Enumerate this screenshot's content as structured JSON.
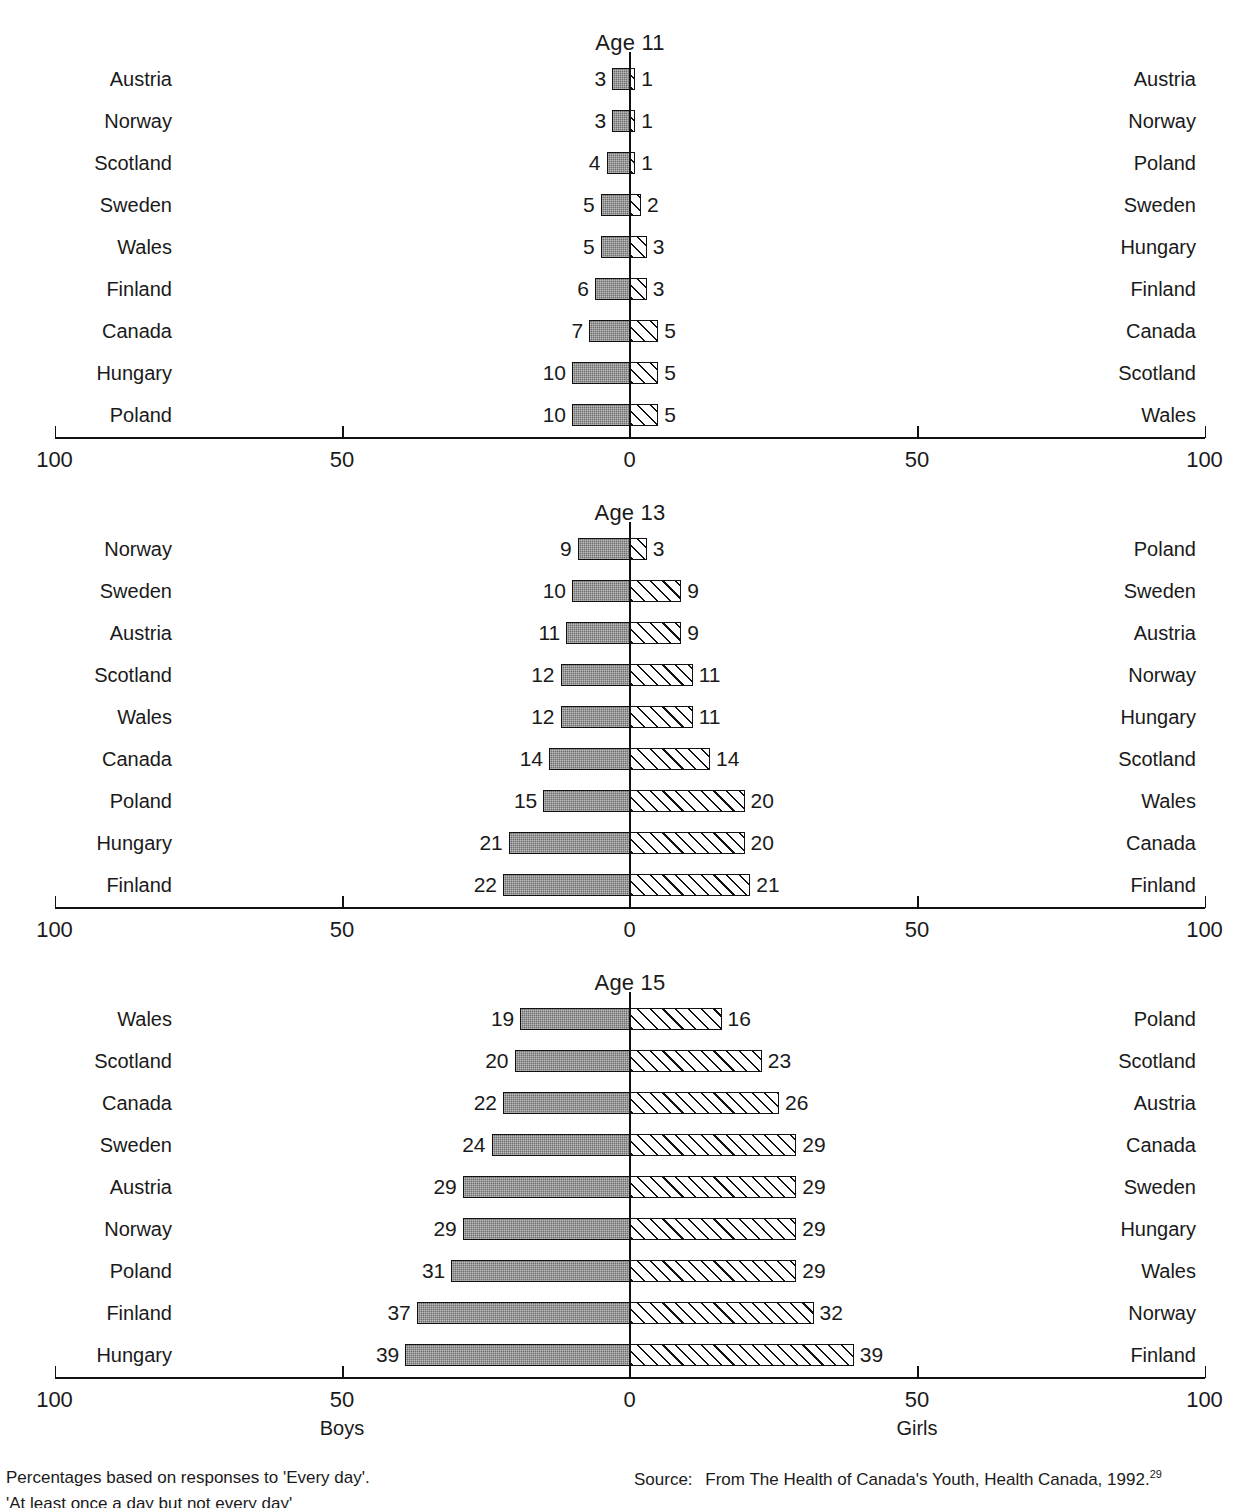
{
  "figure": {
    "title_cropped": "",
    "boys_caption": "Boys",
    "girls_caption": "Girls"
  },
  "axis": {
    "ticks": [
      "100",
      "50",
      "0",
      "50",
      "100"
    ],
    "min": 0,
    "max": 100
  },
  "footnotes": {
    "left_line1": "Percentages based on responses to 'Every day'.",
    "left_line2_cropped": "'At least once a day but not every day'",
    "source_label": "Source:",
    "source_text": "From The Health of Canada's Youth, Health Canada, 1992.",
    "source_superscript": "29"
  },
  "panels": [
    {
      "title": "Age 11",
      "rows": [
        {
          "left_label": "Austria",
          "boys": 3,
          "girls": 1,
          "right_label": "Austria"
        },
        {
          "left_label": "Norway",
          "boys": 3,
          "girls": 1,
          "right_label": "Norway"
        },
        {
          "left_label": "Scotland",
          "boys": 4,
          "girls": 1,
          "right_label": "Poland"
        },
        {
          "left_label": "Sweden",
          "boys": 5,
          "girls": 2,
          "right_label": "Sweden"
        },
        {
          "left_label": "Wales",
          "boys": 5,
          "girls": 3,
          "right_label": "Hungary"
        },
        {
          "left_label": "Finland",
          "boys": 6,
          "girls": 3,
          "right_label": "Finland"
        },
        {
          "left_label": "Canada",
          "boys": 7,
          "girls": 5,
          "right_label": "Canada"
        },
        {
          "left_label": "Hungary",
          "boys": 10,
          "girls": 5,
          "right_label": "Scotland"
        },
        {
          "left_label": "Poland",
          "boys": 10,
          "girls": 5,
          "right_label": "Wales"
        }
      ]
    },
    {
      "title": "Age 13",
      "rows": [
        {
          "left_label": "Norway",
          "boys": 9,
          "girls": 3,
          "right_label": "Poland"
        },
        {
          "left_label": "Sweden",
          "boys": 10,
          "girls": 9,
          "right_label": "Sweden"
        },
        {
          "left_label": "Austria",
          "boys": 11,
          "girls": 9,
          "right_label": "Austria"
        },
        {
          "left_label": "Scotland",
          "boys": 12,
          "girls": 11,
          "right_label": "Norway"
        },
        {
          "left_label": "Wales",
          "boys": 12,
          "girls": 11,
          "right_label": "Hungary"
        },
        {
          "left_label": "Canada",
          "boys": 14,
          "girls": 14,
          "right_label": "Scotland"
        },
        {
          "left_label": "Poland",
          "boys": 15,
          "girls": 20,
          "right_label": "Wales"
        },
        {
          "left_label": "Hungary",
          "boys": 21,
          "girls": 20,
          "right_label": "Canada"
        },
        {
          "left_label": "Finland",
          "boys": 22,
          "girls": 21,
          "right_label": "Finland"
        }
      ]
    },
    {
      "title": "Age 15",
      "rows": [
        {
          "left_label": "Wales",
          "boys": 19,
          "girls": 16,
          "right_label": "Poland"
        },
        {
          "left_label": "Scotland",
          "boys": 20,
          "girls": 23,
          "right_label": "Scotland"
        },
        {
          "left_label": "Canada",
          "boys": 22,
          "girls": 26,
          "right_label": "Austria"
        },
        {
          "left_label": "Sweden",
          "boys": 24,
          "girls": 29,
          "right_label": "Canada"
        },
        {
          "left_label": "Austria",
          "boys": 29,
          "girls": 29,
          "right_label": "Sweden"
        },
        {
          "left_label": "Norway",
          "boys": 29,
          "girls": 29,
          "right_label": "Hungary"
        },
        {
          "left_label": "Poland",
          "boys": 31,
          "girls": 29,
          "right_label": "Wales"
        },
        {
          "left_label": "Finland",
          "boys": 37,
          "girls": 32,
          "right_label": "Norway"
        },
        {
          "left_label": "Hungary",
          "boys": 39,
          "girls": 39,
          "right_label": "Finland"
        }
      ]
    }
  ],
  "chart_data": {
    "type": "bar",
    "subtype": "population-pyramid / back-to-back horizontal bar",
    "xlabel": "Percent",
    "ylabel": "",
    "xlim": [
      0,
      100
    ],
    "grid": false,
    "left_side": "Boys",
    "right_side": "Girls",
    "axis_ticks": [
      100,
      50,
      0,
      50,
      100
    ],
    "panels": [
      {
        "title": "Age 11",
        "categories_left": [
          "Austria",
          "Norway",
          "Scotland",
          "Sweden",
          "Wales",
          "Finland",
          "Canada",
          "Hungary",
          "Poland"
        ],
        "categories_right": [
          "Austria",
          "Norway",
          "Poland",
          "Sweden",
          "Hungary",
          "Finland",
          "Canada",
          "Scotland",
          "Wales"
        ],
        "series": [
          {
            "name": "Boys",
            "values": [
              3,
              3,
              4,
              5,
              5,
              6,
              7,
              10,
              10
            ]
          },
          {
            "name": "Girls",
            "values": [
              1,
              1,
              1,
              2,
              3,
              3,
              5,
              5,
              5
            ]
          }
        ]
      },
      {
        "title": "Age 13",
        "categories_left": [
          "Norway",
          "Sweden",
          "Austria",
          "Scotland",
          "Wales",
          "Canada",
          "Poland",
          "Hungary",
          "Finland"
        ],
        "categories_right": [
          "Poland",
          "Sweden",
          "Austria",
          "Norway",
          "Hungary",
          "Scotland",
          "Wales",
          "Canada",
          "Finland"
        ],
        "series": [
          {
            "name": "Boys",
            "values": [
              9,
              10,
              11,
              12,
              12,
              14,
              15,
              21,
              22
            ]
          },
          {
            "name": "Girls",
            "values": [
              3,
              9,
              9,
              11,
              11,
              14,
              20,
              20,
              21
            ]
          }
        ]
      },
      {
        "title": "Age 15",
        "categories_left": [
          "Wales",
          "Scotland",
          "Canada",
          "Sweden",
          "Austria",
          "Norway",
          "Poland",
          "Finland",
          "Hungary"
        ],
        "categories_right": [
          "Poland",
          "Scotland",
          "Austria",
          "Canada",
          "Sweden",
          "Hungary",
          "Wales",
          "Norway",
          "Finland"
        ],
        "series": [
          {
            "name": "Boys",
            "values": [
              19,
              20,
              22,
              24,
              29,
              29,
              31,
              37,
              39
            ]
          },
          {
            "name": "Girls",
            "values": [
              16,
              23,
              26,
              29,
              29,
              29,
              29,
              32,
              39
            ]
          }
        ]
      }
    ]
  }
}
